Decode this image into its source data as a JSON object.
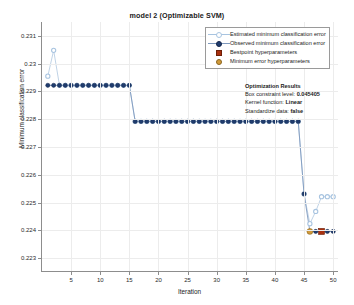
{
  "chart_data": {
    "type": "line",
    "title": "model 2 (Optimizable SVM)",
    "xlabel": "Iteration",
    "ylabel": "Minimum classification error",
    "xlim": [
      0,
      51
    ],
    "ylim": [
      0.2225,
      0.2315
    ],
    "xticks": [
      5,
      10,
      15,
      20,
      25,
      30,
      35,
      40,
      45,
      50
    ],
    "yticks": [
      0.223,
      0.224,
      0.225,
      0.226,
      0.227,
      0.228,
      0.229,
      0.23,
      0.231
    ],
    "ytick_labels": [
      "0.223",
      "0.224",
      "0.225",
      "0.226",
      "0.227",
      "0.228",
      "0.229",
      "0.23",
      "0.231"
    ],
    "grid": true,
    "legend_position": "top-right",
    "series": [
      {
        "name": "Estimated minimum classification error",
        "marker": "open-circle",
        "color": "#a8c4e0",
        "x": [
          1,
          2,
          3,
          4,
          5,
          6,
          7,
          8,
          9,
          10,
          11,
          12,
          13,
          14,
          15,
          16,
          17,
          18,
          19,
          20,
          21,
          22,
          23,
          24,
          25,
          26,
          27,
          28,
          29,
          30,
          31,
          32,
          33,
          34,
          35,
          36,
          37,
          38,
          39,
          40,
          41,
          42,
          43,
          44,
          45,
          46,
          47,
          48,
          49,
          50
        ],
        "values": [
          0.22955,
          0.23048,
          0.22922,
          0.22922,
          0.22922,
          0.22922,
          0.22922,
          0.22922,
          0.22922,
          0.22922,
          0.22922,
          0.22922,
          0.22922,
          0.22922,
          0.22922,
          0.22792,
          0.22792,
          0.22792,
          0.22792,
          0.22792,
          0.22792,
          0.22792,
          0.22792,
          0.22792,
          0.22792,
          0.22792,
          0.22792,
          0.22792,
          0.22792,
          0.22792,
          0.22792,
          0.22792,
          0.22792,
          0.22792,
          0.22792,
          0.22792,
          0.22792,
          0.22792,
          0.22792,
          0.22792,
          0.22792,
          0.22792,
          0.22792,
          0.22792,
          0.22531,
          0.22424,
          0.22468,
          0.22521,
          0.22521,
          0.22521
        ]
      },
      {
        "name": "Observed minimum classification error",
        "marker": "filled-circle",
        "color": "#1f3c6e",
        "x": [
          1,
          2,
          3,
          4,
          5,
          6,
          7,
          8,
          9,
          10,
          11,
          12,
          13,
          14,
          15,
          16,
          17,
          18,
          19,
          20,
          21,
          22,
          23,
          24,
          25,
          26,
          27,
          28,
          29,
          30,
          31,
          32,
          33,
          34,
          35,
          36,
          37,
          38,
          39,
          40,
          41,
          42,
          43,
          44,
          45,
          46,
          47,
          48,
          49,
          50
        ],
        "values": [
          0.22922,
          0.22922,
          0.22922,
          0.22922,
          0.22922,
          0.22922,
          0.22922,
          0.22922,
          0.22922,
          0.22922,
          0.22922,
          0.22922,
          0.22922,
          0.22922,
          0.22922,
          0.22792,
          0.22792,
          0.22792,
          0.22792,
          0.22792,
          0.22792,
          0.22792,
          0.22792,
          0.22792,
          0.22792,
          0.22792,
          0.22792,
          0.22792,
          0.22792,
          0.22792,
          0.22792,
          0.22792,
          0.22792,
          0.22792,
          0.22792,
          0.22792,
          0.22792,
          0.22792,
          0.22792,
          0.22792,
          0.22792,
          0.22792,
          0.22792,
          0.22792,
          0.22531,
          0.22396,
          0.22396,
          0.22396,
          0.22396,
          0.22396
        ]
      }
    ],
    "markers": [
      {
        "name": "Bestpoint hyperparameters",
        "marker": "filled-square",
        "color": "#a8300f",
        "x": 48,
        "y": 0.22396
      },
      {
        "name": "Minimum error hyperparameters",
        "marker": "filled-circle",
        "color": "#d19a3a",
        "x": 46,
        "y": 0.22396
      }
    ]
  },
  "legend": {
    "items": [
      {
        "label": "Estimated minimum classification error",
        "key": "line-open-circle",
        "color": "#a8c4e0"
      },
      {
        "label": "Observed minimum classification error",
        "key": "line-filled-circle",
        "color": "#1f3c6e"
      },
      {
        "label": "Bestpoint hyperparameters",
        "key": "filled-square",
        "color": "#a8300f"
      },
      {
        "label": "Minimum error hyperparameters",
        "key": "filled-circle",
        "color": "#d19a3a"
      }
    ]
  },
  "optimization_results": {
    "heading": "Optimization Results",
    "rows": [
      {
        "label": "Box constraint level:",
        "value": "0.045405"
      },
      {
        "label": "Kernel function:",
        "value": "Linear"
      },
      {
        "label": "Standardize data:",
        "value": "false"
      }
    ]
  }
}
